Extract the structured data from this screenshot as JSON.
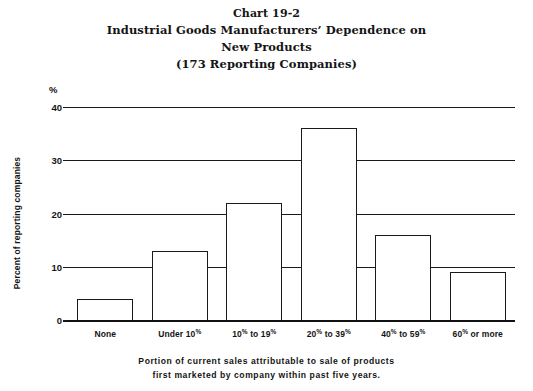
{
  "chart_data": {
    "type": "bar",
    "title_lines": [
      "Chart 19-2",
      "Industrial Goods Manufacturers’ Dependence on",
      "New Products",
      "(173 Reporting Companies)"
    ],
    "categories": [
      "None",
      "Under 10%",
      "10% to 19%",
      "20% to 39%",
      "40% to 59%",
      "60% or more"
    ],
    "values": [
      4,
      13,
      22,
      36,
      16,
      9
    ],
    "xlabel": "Portion of current sales attributable to sale of products first marketed by company within past five years.",
    "ylabel": "Percent of reporting companies",
    "ylim": [
      0,
      40
    ],
    "yticks": [
      0,
      10,
      20,
      30,
      40
    ],
    "ytick_labels": [
      "0",
      "10",
      "20",
      "30",
      "40"
    ],
    "y_unit_symbol": "%",
    "grid": "horizontal",
    "legend": "none",
    "bar_fill_color": "#ffffff",
    "bar_edge_color": "#1a1a1a",
    "background_color": "#ffffff"
  },
  "axis": {
    "x_tick_labels_html": [
      "None",
      "Under 10<sup>%</sup>",
      "10<sup>%</sup> to 19<sup>%</sup>",
      "20<sup>%</sup> to 39<sup>%</sup>",
      "40<sup>%</sup> to 59<sup>%</sup>",
      "60<sup>%</sup> or more"
    ]
  },
  "footnote": {
    "line1": "Portion of current sales attributable to sale of products",
    "line2": "first marketed by company within past five years."
  }
}
